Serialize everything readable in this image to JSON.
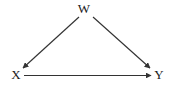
{
  "diagram": {
    "type": "directed-acyclic-graph",
    "title": "",
    "background_color": "#ffffff",
    "stroke_color": "#333333",
    "label_color": "#1a1a1a",
    "nodes": [
      {
        "id": "W",
        "label": "W",
        "x": 84,
        "y": 9
      },
      {
        "id": "X",
        "label": "X",
        "x": 16,
        "y": 75
      },
      {
        "id": "Y",
        "label": "Y",
        "x": 159,
        "y": 75
      }
    ],
    "edges": [
      {
        "id": "w-to-x",
        "from": "W",
        "to": "X",
        "label": "",
        "directed": true,
        "style": "solid",
        "x1": 79,
        "y1": 17,
        "x2": 23,
        "y2": 68
      },
      {
        "id": "w-to-y",
        "from": "W",
        "to": "Y",
        "label": "",
        "directed": true,
        "style": "solid",
        "x1": 93,
        "y1": 17,
        "x2": 150,
        "y2": 68
      },
      {
        "id": "x-to-y",
        "from": "X",
        "to": "Y",
        "label": "",
        "directed": true,
        "style": "solid",
        "x1": 24,
        "y1": 75,
        "x2": 151,
        "y2": 75
      }
    ]
  }
}
